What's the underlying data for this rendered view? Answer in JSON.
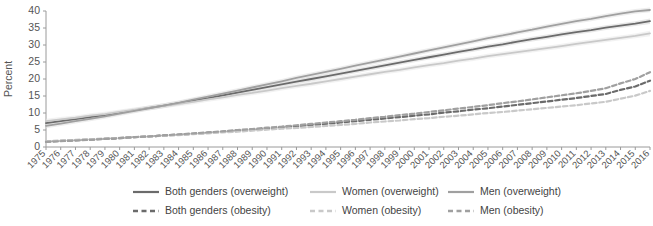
{
  "chart_data": {
    "type": "line",
    "title": "",
    "xlabel": "",
    "ylabel": "Percent",
    "ylim": [
      0,
      40
    ],
    "ytick_step": 5,
    "yticks": [
      0,
      5,
      10,
      15,
      20,
      25,
      30,
      35,
      40
    ],
    "grid": false,
    "legend_position": "bottom",
    "x": [
      1975,
      1976,
      1977,
      1978,
      1979,
      1980,
      1981,
      1982,
      1983,
      1984,
      1985,
      1986,
      1987,
      1988,
      1989,
      1990,
      1991,
      1992,
      1993,
      1994,
      1995,
      1996,
      1997,
      1998,
      1999,
      2000,
      2001,
      2002,
      2003,
      2004,
      2005,
      2006,
      2007,
      2008,
      2009,
      2010,
      2011,
      2012,
      2013,
      2014,
      2015,
      2016
    ],
    "categories": [
      "1975",
      "1976",
      "1977",
      "1978",
      "1979",
      "1980",
      "1981",
      "1982",
      "1983",
      "1984",
      "1985",
      "1986",
      "1987",
      "1988",
      "1989",
      "1990",
      "1991",
      "1992",
      "1993",
      "1994",
      "1995",
      "1996",
      "1997",
      "1998",
      "1999",
      "2000",
      "2001",
      "2002",
      "2003",
      "2004",
      "2005",
      "2006",
      "2007",
      "2008",
      "2009",
      "2010",
      "2011",
      "2012",
      "2013",
      "2014",
      "2015",
      "2016"
    ],
    "series": [
      {
        "name": "Both genders (overweight)",
        "style": "solid",
        "color": "#6b6b6b",
        "band_color": "#d6d6d6",
        "values": [
          7.0,
          7.6,
          8.2,
          8.8,
          9.4,
          10.1,
          10.8,
          11.5,
          12.2,
          12.9,
          13.7,
          14.4,
          15.2,
          16.0,
          16.8,
          17.6,
          18.4,
          19.2,
          20.0,
          20.8,
          21.6,
          22.4,
          23.2,
          24.0,
          24.8,
          25.6,
          26.4,
          27.2,
          28.0,
          28.7,
          29.5,
          30.2,
          31.0,
          31.7,
          32.4,
          33.1,
          33.8,
          34.4,
          35.1,
          35.7,
          36.3,
          37.0
        ],
        "band_low": [
          6.3,
          6.9,
          7.5,
          8.1,
          8.7,
          9.4,
          10.1,
          10.8,
          11.5,
          12.2,
          13.0,
          13.7,
          14.5,
          15.3,
          16.1,
          16.9,
          17.7,
          18.5,
          19.3,
          20.1,
          20.9,
          21.7,
          22.5,
          23.3,
          24.1,
          24.9,
          25.7,
          26.5,
          27.3,
          28.0,
          28.8,
          29.5,
          30.3,
          31.0,
          31.7,
          32.4,
          33.1,
          33.7,
          34.4,
          35.0,
          35.6,
          36.2
        ],
        "band_high": [
          7.7,
          8.3,
          8.9,
          9.5,
          10.1,
          10.8,
          11.5,
          12.2,
          12.9,
          13.6,
          14.4,
          15.1,
          15.9,
          16.7,
          17.5,
          18.3,
          19.1,
          19.9,
          20.7,
          21.5,
          22.3,
          23.1,
          23.9,
          24.7,
          25.5,
          26.3,
          27.1,
          27.9,
          28.7,
          29.4,
          30.2,
          30.9,
          31.7,
          32.4,
          33.1,
          33.8,
          34.5,
          35.1,
          35.8,
          36.4,
          37.0,
          37.8
        ]
      },
      {
        "name": "Women (overweight)",
        "style": "solid",
        "color": "#c9c9c9",
        "band_color": "#e8e8e8",
        "values": [
          7.6,
          8.1,
          8.6,
          9.2,
          9.7,
          10.3,
          10.9,
          11.5,
          12.1,
          12.7,
          13.3,
          14.0,
          14.6,
          15.3,
          15.9,
          16.6,
          17.3,
          18.0,
          18.6,
          19.3,
          20.0,
          20.7,
          21.4,
          22.1,
          22.7,
          23.4,
          24.1,
          24.7,
          25.4,
          26.0,
          26.7,
          27.3,
          27.9,
          28.5,
          29.1,
          29.7,
          30.3,
          30.9,
          31.5,
          32.1,
          32.7,
          33.4
        ],
        "band_low": [
          6.9,
          7.4,
          7.9,
          8.5,
          9.0,
          9.6,
          10.2,
          10.8,
          11.4,
          12.0,
          12.6,
          13.3,
          13.9,
          14.6,
          15.2,
          15.9,
          16.6,
          17.3,
          17.9,
          18.6,
          19.3,
          20.0,
          20.7,
          21.4,
          22.0,
          22.7,
          23.4,
          24.0,
          24.7,
          25.3,
          26.0,
          26.6,
          27.2,
          27.8,
          28.4,
          29.0,
          29.6,
          30.2,
          30.8,
          31.4,
          32.0,
          32.6
        ],
        "band_high": [
          8.3,
          8.8,
          9.3,
          9.9,
          10.4,
          11.0,
          11.6,
          12.2,
          12.8,
          13.4,
          14.0,
          14.7,
          15.3,
          16.0,
          16.6,
          17.3,
          18.0,
          18.7,
          19.3,
          20.0,
          20.7,
          21.4,
          22.1,
          22.8,
          23.4,
          24.1,
          24.8,
          25.4,
          26.1,
          26.7,
          27.4,
          28.0,
          28.6,
          29.2,
          29.8,
          30.4,
          31.0,
          31.6,
          32.2,
          32.8,
          33.4,
          34.2
        ]
      },
      {
        "name": "Men (overweight)",
        "style": "solid",
        "color": "#a0a0a0",
        "band_color": "#dedede",
        "values": [
          6.2,
          6.9,
          7.6,
          8.3,
          9.0,
          9.8,
          10.6,
          11.4,
          12.2,
          13.0,
          13.9,
          14.8,
          15.7,
          16.6,
          17.5,
          18.4,
          19.3,
          20.3,
          21.2,
          22.1,
          23.0,
          23.9,
          24.8,
          25.7,
          26.6,
          27.5,
          28.4,
          29.3,
          30.2,
          31.1,
          32.0,
          32.8,
          33.7,
          34.5,
          35.4,
          36.2,
          37.0,
          37.7,
          38.5,
          39.2,
          39.9,
          40.3
        ],
        "band_low": [
          5.5,
          6.2,
          6.9,
          7.6,
          8.3,
          9.1,
          9.9,
          10.7,
          11.5,
          12.3,
          13.2,
          14.1,
          15.0,
          15.9,
          16.8,
          17.7,
          18.6,
          19.6,
          20.5,
          21.4,
          22.3,
          23.2,
          24.1,
          25.0,
          25.9,
          26.8,
          27.7,
          28.6,
          29.5,
          30.4,
          31.3,
          32.1,
          33.0,
          33.8,
          34.7,
          35.5,
          36.3,
          37.0,
          37.8,
          38.5,
          39.2,
          39.6
        ],
        "band_high": [
          6.9,
          7.6,
          8.3,
          9.0,
          9.7,
          10.5,
          11.3,
          12.1,
          12.9,
          13.7,
          14.6,
          15.5,
          16.4,
          17.3,
          18.2,
          19.1,
          20.0,
          21.0,
          21.9,
          22.8,
          23.7,
          24.6,
          25.5,
          26.4,
          27.3,
          28.2,
          29.1,
          30.0,
          30.9,
          31.8,
          32.7,
          33.5,
          34.4,
          35.2,
          36.1,
          36.9,
          37.7,
          38.4,
          39.2,
          39.9,
          40.6,
          41.0
        ]
      },
      {
        "name": "Both genders (obesity)",
        "style": "dashed",
        "color": "#6b6b6b",
        "band_color": "#d6d6d6",
        "values": [
          1.6,
          1.8,
          2.0,
          2.2,
          2.4,
          2.6,
          2.9,
          3.1,
          3.4,
          3.6,
          3.9,
          4.2,
          4.5,
          4.8,
          5.1,
          5.4,
          5.8,
          6.1,
          6.5,
          6.8,
          7.2,
          7.6,
          8.0,
          8.4,
          8.8,
          9.2,
          9.6,
          10.1,
          10.5,
          11.0,
          11.4,
          11.9,
          12.4,
          12.9,
          13.4,
          13.9,
          14.4,
          15.0,
          15.6,
          16.8,
          17.8,
          19.5
        ],
        "band_low": null,
        "band_high": null
      },
      {
        "name": "Women (obesity)",
        "style": "dashed",
        "color": "#c9c9c9",
        "band_color": "#e8e8e8",
        "values": [
          1.7,
          1.9,
          2.1,
          2.3,
          2.5,
          2.7,
          2.9,
          3.1,
          3.3,
          3.5,
          3.8,
          4.0,
          4.3,
          4.5,
          4.8,
          5.1,
          5.4,
          5.6,
          5.9,
          6.2,
          6.5,
          6.8,
          7.2,
          7.5,
          7.8,
          8.2,
          8.5,
          8.9,
          9.2,
          9.6,
          10.0,
          10.3,
          10.7,
          11.1,
          11.5,
          11.9,
          12.3,
          12.8,
          13.3,
          14.2,
          15.1,
          16.5
        ],
        "band_low": null,
        "band_high": null
      },
      {
        "name": "Men (obesity)",
        "style": "dashed",
        "color": "#a0a0a0",
        "band_color": "#dedede",
        "values": [
          1.5,
          1.7,
          1.9,
          2.1,
          2.4,
          2.6,
          2.9,
          3.1,
          3.4,
          3.7,
          4.0,
          4.3,
          4.6,
          5.0,
          5.3,
          5.7,
          6.0,
          6.4,
          6.8,
          7.2,
          7.6,
          8.0,
          8.5,
          8.9,
          9.4,
          9.8,
          10.3,
          10.8,
          11.3,
          11.8,
          12.3,
          12.9,
          13.4,
          14.0,
          14.6,
          15.2,
          15.8,
          16.5,
          17.3,
          18.7,
          20.0,
          22.0
        ],
        "band_low": null,
        "band_high": null
      }
    ],
    "legend": [
      {
        "label": "Both genders (overweight)",
        "style": "solid",
        "color": "#6b6b6b"
      },
      {
        "label": "Women (overweight)",
        "style": "solid",
        "color": "#c9c9c9"
      },
      {
        "label": "Men (overweight)",
        "style": "solid",
        "color": "#a0a0a0"
      },
      {
        "label": "Both genders (obesity)",
        "style": "dashed",
        "color": "#6b6b6b"
      },
      {
        "label": "Women (obesity)",
        "style": "dashed",
        "color": "#c9c9c9"
      },
      {
        "label": "Men (obesity)",
        "style": "dashed",
        "color": "#a0a0a0"
      }
    ]
  }
}
